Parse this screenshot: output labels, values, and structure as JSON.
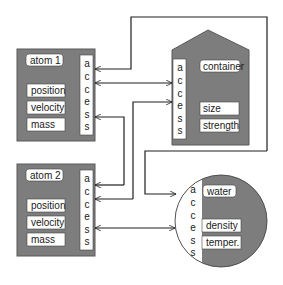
{
  "colors": {
    "object_fill": "#7d7d7d",
    "object_stroke": "#555555",
    "field_fill": "#ffffff",
    "line": "#1e1e1e",
    "background": "#ffffff"
  },
  "access_label": [
    "a",
    "c",
    "c",
    "e",
    "s",
    "s"
  ],
  "objects": {
    "atom1": {
      "shape": "rectangle",
      "name": "atom 1",
      "fields": [
        "position",
        "velocity",
        "mass"
      ]
    },
    "atom2": {
      "shape": "rectangle",
      "name": "atom 2",
      "fields": [
        "position",
        "velocity",
        "mass"
      ]
    },
    "container": {
      "shape": "house",
      "name": "container",
      "fields": [
        "size",
        "strength"
      ]
    },
    "water": {
      "shape": "circle",
      "name": "water",
      "fields": [
        "density",
        "temper."
      ]
    }
  },
  "connections": [
    {
      "from": "container",
      "to": "atom1",
      "direction": "to-atom1",
      "route": "outer loop over top"
    },
    {
      "from": "atom1",
      "to": "container",
      "direction": "bidirectional"
    },
    {
      "from": "atom2",
      "to": "atom1",
      "direction": "to-atom1"
    },
    {
      "from": "atom1",
      "to": "container",
      "direction": "to-container"
    },
    {
      "from": "atom1",
      "to": "atom2",
      "direction": "to-atom2"
    },
    {
      "from": "container",
      "to": "atom2",
      "direction": "to-atom2"
    },
    {
      "from": "container",
      "to": "water",
      "direction": "to-water",
      "route": "outer loop on right"
    },
    {
      "from": "atom2",
      "to": "water",
      "direction": "bidirectional"
    }
  ]
}
